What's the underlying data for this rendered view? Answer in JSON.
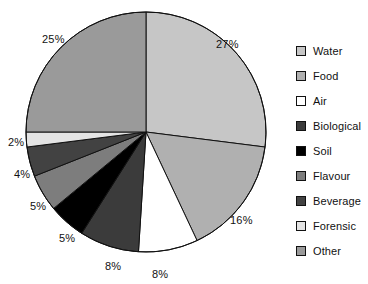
{
  "chart_data": {
    "type": "pie",
    "title": "",
    "subtitle": "",
    "xlabel": "",
    "ylabel": "",
    "legend_position": "right",
    "grid": false,
    "start_angle_deg": 0,
    "direction": "clockwise",
    "categories": [
      "Water",
      "Food",
      "Air",
      "Biological",
      "Soil",
      "Flavour",
      "Beverage",
      "Forensic",
      "Other"
    ],
    "values": [
      27,
      16,
      8,
      8,
      5,
      5,
      4,
      2,
      25
    ],
    "value_unit": "%",
    "labels": [
      "27%",
      "16%",
      "8%",
      "8%",
      "5%",
      "5%",
      "4%",
      "2%",
      "25%"
    ],
    "colors": [
      "#c6c6c6",
      "#b0b0b0",
      "#ffffff",
      "#3b3b3b",
      "#000000",
      "#7d7d7d",
      "#424242",
      "#e4e4e4",
      "#9a9a9a"
    ],
    "slices": [
      {
        "name": "Water",
        "value": 27,
        "label": "27%",
        "color": "#c6c6c6"
      },
      {
        "name": "Food",
        "value": 16,
        "label": "16%",
        "color": "#b0b0b0"
      },
      {
        "name": "Air",
        "value": 8,
        "label": "8%",
        "color": "#ffffff"
      },
      {
        "name": "Biological",
        "value": 8,
        "label": "8%",
        "color": "#3b3b3b"
      },
      {
        "name": "Soil",
        "value": 5,
        "label": "5%",
        "color": "#000000"
      },
      {
        "name": "Flavour",
        "value": 5,
        "label": "5%",
        "color": "#7d7d7d"
      },
      {
        "name": "Beverage",
        "value": 4,
        "label": "4%",
        "color": "#424242"
      },
      {
        "name": "Forensic",
        "value": 2,
        "label": "2%",
        "color": "#e4e4e4"
      },
      {
        "name": "Other",
        "value": 25,
        "label": "25%",
        "color": "#9a9a9a"
      }
    ]
  },
  "legend": {
    "items": [
      {
        "label": "Water",
        "color": "#c6c6c6"
      },
      {
        "label": "Food",
        "color": "#b0b0b0"
      },
      {
        "label": "Air",
        "color": "#ffffff"
      },
      {
        "label": "Biological",
        "color": "#3b3b3b"
      },
      {
        "label": "Soil",
        "color": "#000000"
      },
      {
        "label": "Flavour",
        "color": "#7d7d7d"
      },
      {
        "label": "Beverage",
        "color": "#424242"
      },
      {
        "label": "Forensic",
        "color": "#e4e4e4"
      },
      {
        "label": "Other",
        "color": "#9a9a9a"
      }
    ]
  },
  "slice_labels": [
    {
      "text": "27%",
      "x": 216,
      "y": 38
    },
    {
      "text": "16%",
      "x": 230,
      "y": 214
    },
    {
      "text": "8%",
      "x": 152,
      "y": 268
    },
    {
      "text": "8%",
      "x": 105,
      "y": 260
    },
    {
      "text": "5%",
      "x": 59,
      "y": 232
    },
    {
      "text": "5%",
      "x": 30,
      "y": 200
    },
    {
      "text": "4%",
      "x": 14,
      "y": 168
    },
    {
      "text": "2%",
      "x": 8,
      "y": 136
    },
    {
      "text": "25%",
      "x": 42,
      "y": 33
    }
  ],
  "geometry": {
    "cx": 146,
    "cy": 132,
    "r": 120,
    "stroke": "#111111",
    "stroke_width": 1
  }
}
